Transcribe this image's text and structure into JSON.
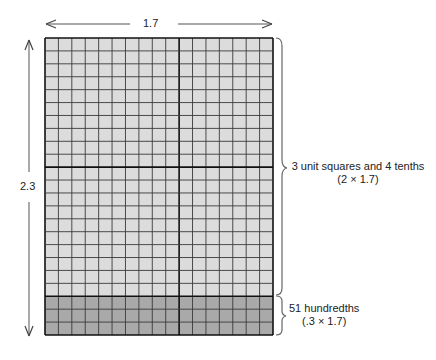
{
  "diagram": {
    "width_label": "1.7",
    "height_label": "2.3",
    "grid": {
      "columns": 17,
      "rows": 23,
      "unit_columns": 10,
      "unit_rows": 10,
      "shaded_rows_bottom": 3
    },
    "annotations": [
      {
        "line1": "3 unit squares and 4 tenths",
        "line2": "(2 × 1.7)"
      },
      {
        "line1": "51 hundredths",
        "line2": "(.3 × 1.7)"
      }
    ],
    "colors": {
      "light_cell": "#dcdcdc",
      "dark_cell": "#a9a9a9",
      "grid_line": "#3a3a3a",
      "thick_line": "#111111",
      "arrow": "#444444",
      "brace": "#666666"
    }
  }
}
